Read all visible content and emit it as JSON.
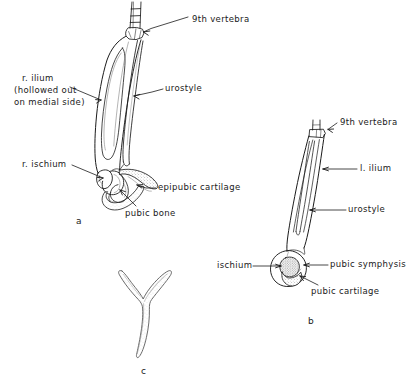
{
  "figure": {
    "ink_color": "#1b1b1b",
    "paper_color": "#ffffff",
    "shade_color": "#8d8d8d",
    "panels": [
      {
        "id": "a",
        "id_label": "a",
        "caption_pos": {
          "x": 76,
          "y": 216
        },
        "labels": [
          {
            "name": "9th-vertebra",
            "text": "9th vertebra",
            "x": 192,
            "y": 14
          },
          {
            "name": "r-ilium",
            "text": "r. ilium",
            "x": 22,
            "y": 73
          },
          {
            "name": "r-ilium-note-line1",
            "text": "(hollowed out",
            "x": 14,
            "y": 85
          },
          {
            "name": "r-ilium-note-line2",
            "text": "on medial side)",
            "x": 14,
            "y": 97
          },
          {
            "name": "urostyle",
            "text": "urostyle",
            "x": 165,
            "y": 86
          },
          {
            "name": "r-ischium",
            "text": "r. ischium",
            "x": 22,
            "y": 162
          },
          {
            "name": "epipubic-cartilage",
            "text": "epipubic cartilage",
            "x": 158,
            "y": 185
          },
          {
            "name": "pubic-bone",
            "text": "pubic bone",
            "x": 125,
            "y": 211
          }
        ]
      },
      {
        "id": "b",
        "id_label": "b",
        "caption_pos": {
          "x": 308,
          "y": 316
        },
        "labels": [
          {
            "name": "9th-vertebra",
            "text": "9th vertebra",
            "x": 340,
            "y": 120
          },
          {
            "name": "l-ilium",
            "text": "l. ilium",
            "x": 360,
            "y": 166
          },
          {
            "name": "urostyle",
            "text": "urostyle",
            "x": 348,
            "y": 207
          },
          {
            "name": "ischium",
            "text": "ischium",
            "x": 217,
            "y": 263
          },
          {
            "name": "pubic-symphysis",
            "text": "pubic symphysis",
            "x": 330,
            "y": 262
          },
          {
            "name": "pubic-cartilage",
            "text": "pubic cartilage",
            "x": 311,
            "y": 289
          }
        ]
      },
      {
        "id": "c",
        "id_label": "c",
        "caption_pos": {
          "x": 141,
          "y": 366
        },
        "labels": []
      }
    ]
  }
}
